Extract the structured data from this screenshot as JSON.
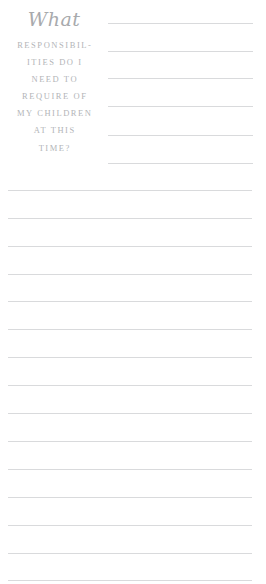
{
  "page": {
    "background_color": "#ffffff",
    "rule_color": "#d9dadc",
    "text_color": "#b3b5b8",
    "script_color": "#a8aaad"
  },
  "prompt": {
    "script_word": "What",
    "caps_lines": [
      "RESPONSIBIL-",
      "ITIES DO I",
      "NEED TO",
      "REQUIRE OF",
      "MY CHILDREN",
      "AT THIS",
      "TIME?"
    ],
    "full_text": "What RESPONSIBILITIES DO I NEED TO REQUIRE OF MY CHILDREN AT THIS TIME?"
  },
  "writing_area": {
    "short_rules": [
      {
        "y": 23
      },
      {
        "y": 51
      },
      {
        "y": 78
      },
      {
        "y": 106
      },
      {
        "y": 135
      },
      {
        "y": 163
      }
    ],
    "full_rules": [
      {
        "y": 190
      },
      {
        "y": 218
      },
      {
        "y": 246
      },
      {
        "y": 274
      },
      {
        "y": 301
      },
      {
        "y": 329
      },
      {
        "y": 357
      },
      {
        "y": 385
      },
      {
        "y": 413
      },
      {
        "y": 441
      },
      {
        "y": 469
      },
      {
        "y": 497
      },
      {
        "y": 525
      },
      {
        "y": 553
      },
      {
        "y": 580
      }
    ]
  }
}
